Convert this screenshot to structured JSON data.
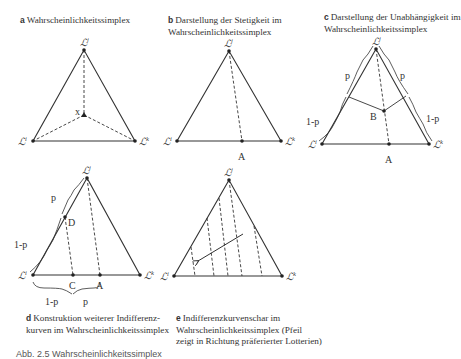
{
  "panels": {
    "a": {
      "letter": "a",
      "caption": "Wahrscheinlichkeitssimplex",
      "x_label": "x"
    },
    "b": {
      "letter": "b",
      "caption": "Darstellung der Stetigkeit im Wahrscheinlichkeitssimplex",
      "point_label": "A"
    },
    "c": {
      "letter": "c",
      "caption": "Darstellung der Unabhängigkeit im Wahrscheinlichkeitssimplex",
      "point_A": "A",
      "point_B": "B",
      "p": "p",
      "one_minus_p": "1-p"
    },
    "d": {
      "letter": "d",
      "caption": "Konstruktion weiterer Indifferenzkurven im Wahrscheinlichkeitssimplex",
      "caption_line1": "Konstruktion weiterer Indifferenz-",
      "caption_line2": "kurven im Wahrscheinlichkeitssimplex",
      "point_A": "A",
      "point_C": "C",
      "point_D": "D",
      "p": "p",
      "one_minus_p": "1-p"
    },
    "e": {
      "letter": "e",
      "caption_line1": "Indifferenzkurvenschar im",
      "caption_line2": "Wahrscheinlichkeitssimplex (Pfeil",
      "caption_line3": "zeigt in Richtung präferierter Lotterien)"
    }
  },
  "vertices": {
    "symbol": "L",
    "top": "j",
    "left": "i",
    "right": "k"
  },
  "footer": "Abb. 2.5 Wahrscheinlichkeitssimplex"
}
